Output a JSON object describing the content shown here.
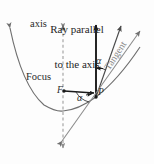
{
  "figure": {
    "title_line1": "Ray parallel",
    "title_line2": "to the axis",
    "labels": {
      "axis": "axis",
      "focus": "Focus",
      "focus_point": "F",
      "point_p": "P",
      "alpha_upper": "α",
      "alpha_lower": "α",
      "tangent": "Tangent"
    },
    "caption": "",
    "colors": {
      "background": "#fdfdfd",
      "curve": "#6f6f6f",
      "ray": "#1a1a1a",
      "axis_dashed": "#9a9a9a",
      "tangent_line": "#8a8a8a",
      "reflected_ray": "#4a4a4a",
      "text": "#2b2b2b",
      "tangent_text": "#8a8a8a"
    },
    "geometry": {
      "axis_x": 63,
      "focus_x": 63,
      "focus_y": 91,
      "point_p_x": 96,
      "point_p_y": 97,
      "vertex_x": 63,
      "vertex_y": 111
    }
  }
}
